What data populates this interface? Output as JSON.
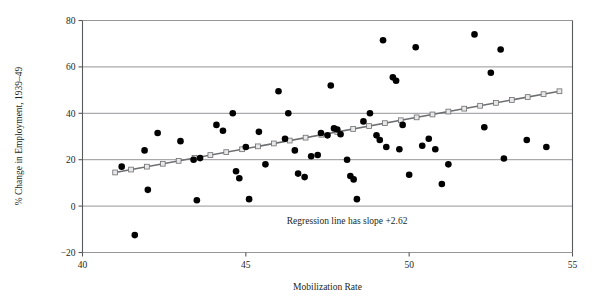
{
  "chart_data": {
    "type": "scatter",
    "title": "",
    "xlabel": "Mobilization Rate",
    "ylabel": "% Change in Employment, 1939–49",
    "xlim": [
      40,
      55
    ],
    "ylim": [
      -20,
      80
    ],
    "xticks": [
      40,
      45,
      50,
      55
    ],
    "xtick_labels": [
      "40",
      "45",
      "50",
      "55"
    ],
    "yticks": [
      -20,
      0,
      20,
      40,
      60,
      80
    ],
    "ytick_labels": [
      "−20",
      "0",
      "20",
      "40",
      "60",
      "80"
    ],
    "grid": "horizontal",
    "legend": "none",
    "annotations": [
      {
        "text": "Regression line has slope +2.62",
        "x": 48.1,
        "y": -7.5
      }
    ],
    "series": [
      {
        "name": "States",
        "marker": "filled-circle",
        "color": "#000000",
        "points": [
          [
            41.2,
            17.0
          ],
          [
            41.6,
            -12.5
          ],
          [
            41.9,
            24.0
          ],
          [
            42.0,
            7.0
          ],
          [
            42.3,
            31.5
          ],
          [
            43.0,
            28.0
          ],
          [
            43.4,
            20.0
          ],
          [
            43.5,
            2.5
          ],
          [
            43.6,
            20.7
          ],
          [
            44.1,
            35.0
          ],
          [
            44.3,
            32.5
          ],
          [
            44.6,
            40.0
          ],
          [
            44.7,
            15.0
          ],
          [
            44.8,
            12.0
          ],
          [
            45.0,
            25.5
          ],
          [
            45.1,
            3.0
          ],
          [
            45.4,
            32.0
          ],
          [
            45.6,
            18.0
          ],
          [
            46.0,
            49.5
          ],
          [
            46.2,
            29.0
          ],
          [
            46.3,
            40.0
          ],
          [
            46.5,
            24.0
          ],
          [
            46.6,
            14.0
          ],
          [
            46.8,
            12.5
          ],
          [
            47.0,
            21.5
          ],
          [
            47.2,
            22.0
          ],
          [
            47.3,
            31.5
          ],
          [
            47.5,
            30.5
          ],
          [
            47.6,
            52.0
          ],
          [
            47.7,
            33.5
          ],
          [
            47.8,
            33.0
          ],
          [
            47.9,
            31.0
          ],
          [
            48.1,
            20.0
          ],
          [
            48.2,
            13.0
          ],
          [
            48.3,
            11.5
          ],
          [
            48.4,
            3.0
          ],
          [
            48.6,
            36.5
          ],
          [
            48.8,
            40.0
          ],
          [
            49.0,
            30.5
          ],
          [
            49.1,
            28.5
          ],
          [
            49.2,
            71.5
          ],
          [
            49.3,
            25.5
          ],
          [
            49.5,
            55.5
          ],
          [
            49.6,
            54.0
          ],
          [
            49.7,
            24.5
          ],
          [
            49.8,
            35.0
          ],
          [
            50.0,
            13.5
          ],
          [
            50.2,
            68.5
          ],
          [
            50.4,
            26.0
          ],
          [
            50.6,
            29.0
          ],
          [
            50.8,
            24.5
          ],
          [
            51.0,
            9.5
          ],
          [
            51.2,
            18.0
          ],
          [
            52.0,
            74.0
          ],
          [
            52.3,
            34.0
          ],
          [
            52.5,
            57.5
          ],
          [
            52.8,
            67.5
          ],
          [
            52.9,
            20.5
          ],
          [
            53.6,
            28.5
          ],
          [
            54.2,
            25.5
          ]
        ]
      }
    ],
    "regression": {
      "label": "Regression line has slope +2.62",
      "slope": 2.62,
      "color": "#6d6e71",
      "marker": "open-square",
      "x_start": 41.0,
      "x_end": 54.6,
      "y_start": 14.5,
      "y_end": 49.5,
      "n_markers": 29
    }
  }
}
